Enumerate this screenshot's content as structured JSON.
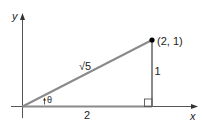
{
  "diagram": {
    "axes": {
      "x_label": "x",
      "y_label": "y"
    },
    "point": {
      "label": "(2, 1)",
      "x": 2,
      "y": 1
    },
    "triangle": {
      "hypotenuse_label": "√5",
      "adjacent_label": "2",
      "opposite_label": "1",
      "angle_label": "θ",
      "right_angle_marker": true
    },
    "colors": {
      "hypotenuse": "#8a8a8a",
      "sides": "#8a8a8a",
      "axes": "#555555",
      "point": "#000000",
      "text": "#222222"
    }
  }
}
